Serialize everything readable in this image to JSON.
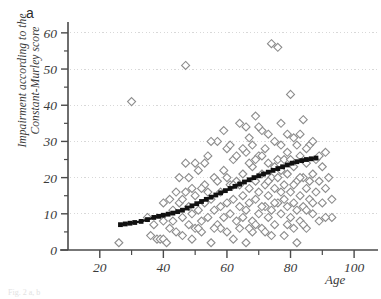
{
  "figure": {
    "panel_label": "a",
    "bottom_caption": "Fig. 2  a, b",
    "colors": {
      "axis": "#4a4a4a",
      "grid": "#d8d8d8",
      "marker_stroke": "#8c8c8c",
      "marker_fill": "#ffffff",
      "trend": "#111111",
      "text": "#3a3a3a"
    }
  },
  "chart_data": {
    "type": "scatter",
    "title": "",
    "subtitle": "",
    "xlabel": "Age",
    "ylabel": "Impairment according to the Constant-Murley score",
    "ylabel_line1": "Impairment according to the",
    "ylabel_line2": "Constant-Murley score",
    "xlim": [
      10,
      105
    ],
    "ylim": [
      0,
      63
    ],
    "xticks": [
      20,
      40,
      60,
      80,
      100
    ],
    "yticks": [
      0,
      10,
      20,
      30,
      40,
      50,
      60
    ],
    "xtick_labels": [
      "20",
      "40",
      "60",
      "80",
      "100"
    ],
    "ytick_labels": [
      "0",
      "10",
      "20",
      "30",
      "40",
      "50",
      "60"
    ],
    "x_minor_ticks": [
      30,
      50,
      70,
      90
    ],
    "y_minor_ticks": [
      5,
      15,
      25,
      35,
      45,
      55
    ],
    "grid": "horizontal-dotted",
    "legend": "none",
    "marker": "open-diamond",
    "series": [
      {
        "name": "Patients",
        "marker": "open-diamond",
        "points": [
          [
            26,
            2
          ],
          [
            30,
            41
          ],
          [
            35,
            9
          ],
          [
            36,
            4
          ],
          [
            37,
            7
          ],
          [
            38,
            3
          ],
          [
            39,
            3
          ],
          [
            40,
            3
          ],
          [
            40,
            8
          ],
          [
            41,
            2
          ],
          [
            42,
            6
          ],
          [
            43,
            11
          ],
          [
            44,
            5
          ],
          [
            45,
            13
          ],
          [
            46,
            4
          ],
          [
            46,
            9
          ],
          [
            47,
            51
          ],
          [
            47,
            16
          ],
          [
            48,
            12
          ],
          [
            48,
            7
          ],
          [
            49,
            10
          ],
          [
            49,
            3
          ],
          [
            50,
            15
          ],
          [
            50,
            6
          ],
          [
            51,
            22
          ],
          [
            51,
            11
          ],
          [
            52,
            8
          ],
          [
            52,
            5
          ],
          [
            53,
            18
          ],
          [
            53,
            13
          ],
          [
            54,
            26
          ],
          [
            54,
            9
          ],
          [
            55,
            2
          ],
          [
            55,
            14
          ],
          [
            56,
            20
          ],
          [
            56,
            11
          ],
          [
            57,
            7
          ],
          [
            57,
            30
          ],
          [
            58,
            16
          ],
          [
            58,
            12
          ],
          [
            59,
            9
          ],
          [
            59,
            22
          ],
          [
            60,
            13
          ],
          [
            60,
            5
          ],
          [
            60,
            28
          ],
          [
            61,
            18
          ],
          [
            61,
            10
          ],
          [
            62,
            25
          ],
          [
            62,
            14
          ],
          [
            62,
            3
          ],
          [
            63,
            8
          ],
          [
            63,
            19
          ],
          [
            64,
            35
          ],
          [
            64,
            12
          ],
          [
            64,
            6
          ],
          [
            65,
            21
          ],
          [
            65,
            15
          ],
          [
            65,
            9
          ],
          [
            66,
            27
          ],
          [
            66,
            11
          ],
          [
            66,
            2
          ],
          [
            67,
            17
          ],
          [
            67,
            13
          ],
          [
            67,
            31
          ],
          [
            68,
            23
          ],
          [
            68,
            8
          ],
          [
            68,
            5
          ],
          [
            69,
            19
          ],
          [
            69,
            14
          ],
          [
            69,
            37
          ],
          [
            70,
            26
          ],
          [
            70,
            10
          ],
          [
            70,
            16
          ],
          [
            71,
            21
          ],
          [
            71,
            6
          ],
          [
            71,
            33
          ],
          [
            72,
            12
          ],
          [
            72,
            18
          ],
          [
            72,
            28
          ],
          [
            73,
            9
          ],
          [
            73,
            24
          ],
          [
            73,
            15
          ],
          [
            74,
            57
          ],
          [
            74,
            20
          ],
          [
            74,
            11
          ],
          [
            75,
            30
          ],
          [
            75,
            17
          ],
          [
            75,
            7
          ],
          [
            76,
            56
          ],
          [
            76,
            25
          ],
          [
            76,
            13
          ],
          [
            77,
            22
          ],
          [
            77,
            10
          ],
          [
            77,
            35
          ],
          [
            78,
            18
          ],
          [
            78,
            14
          ],
          [
            78,
            4
          ],
          [
            79,
            27
          ],
          [
            79,
            21
          ],
          [
            79,
            12
          ],
          [
            80,
            43
          ],
          [
            80,
            16
          ],
          [
            80,
            9
          ],
          [
            81,
            31
          ],
          [
            81,
            23
          ],
          [
            81,
            13
          ],
          [
            82,
            19
          ],
          [
            82,
            11
          ],
          [
            82,
            2
          ],
          [
            83,
            26
          ],
          [
            83,
            15
          ],
          [
            83,
            8
          ],
          [
            84,
            36
          ],
          [
            84,
            20
          ],
          [
            84,
            12
          ],
          [
            85,
            24
          ],
          [
            85,
            17
          ],
          [
            85,
            6
          ],
          [
            86,
            29
          ],
          [
            86,
            14
          ],
          [
            87,
            21
          ],
          [
            87,
            10
          ],
          [
            88,
            25
          ],
          [
            88,
            16
          ],
          [
            89,
            19
          ],
          [
            89,
            8
          ],
          [
            90,
            23
          ],
          [
            90,
            13
          ],
          [
            91,
            27
          ],
          [
            91,
            17
          ],
          [
            92,
            20
          ],
          [
            93,
            14
          ],
          [
            93,
            9
          ],
          [
            44,
            16
          ],
          [
            45,
            20
          ],
          [
            47,
            24
          ],
          [
            49,
            17
          ],
          [
            51,
            6
          ],
          [
            53,
            24
          ],
          [
            55,
            30
          ],
          [
            57,
            19
          ],
          [
            58,
            6
          ],
          [
            59,
            33
          ],
          [
            61,
            29
          ],
          [
            63,
            26
          ],
          [
            64,
            18
          ],
          [
            66,
            34
          ],
          [
            67,
            6
          ],
          [
            68,
            29
          ],
          [
            69,
            7
          ],
          [
            70,
            34
          ],
          [
            71,
            12
          ],
          [
            72,
            5
          ],
          [
            73,
            32
          ],
          [
            74,
            4
          ],
          [
            75,
            13
          ],
          [
            76,
            20
          ],
          [
            77,
            29
          ],
          [
            78,
            25
          ],
          [
            79,
            7
          ],
          [
            80,
            25
          ],
          [
            81,
            6
          ],
          [
            82,
            29
          ],
          [
            83,
            32
          ],
          [
            84,
            7
          ],
          [
            85,
            28
          ],
          [
            86,
            19
          ],
          [
            87,
            30
          ],
          [
            40,
            13
          ],
          [
            42,
            14
          ],
          [
            43,
            8
          ],
          [
            46,
            14
          ],
          [
            48,
            20
          ],
          [
            50,
            24
          ],
          [
            52,
            17
          ],
          [
            54,
            16
          ],
          [
            56,
            6
          ],
          [
            60,
            20
          ],
          [
            62,
            18
          ],
          [
            65,
            28
          ],
          [
            67,
            24
          ],
          [
            69,
            25
          ],
          [
            71,
            26
          ],
          [
            73,
            19
          ],
          [
            75,
            23
          ],
          [
            77,
            16
          ],
          [
            79,
            32
          ],
          [
            81,
            18
          ],
          [
            83,
            20
          ],
          [
            85,
            11
          ],
          [
            87,
            13
          ],
          [
            89,
            26
          ],
          [
            91,
            9
          ]
        ]
      }
    ],
    "trendline": {
      "name": "Fitted trend",
      "style": "thick-black-squares",
      "points": [
        [
          26.5,
          7.0
        ],
        [
          28,
          7.2
        ],
        [
          29.5,
          7.4
        ],
        [
          31,
          7.6
        ],
        [
          33,
          7.9
        ],
        [
          35,
          8.4
        ],
        [
          37,
          9.0
        ],
        [
          38.5,
          9.3
        ],
        [
          40,
          9.6
        ],
        [
          41.5,
          9.9
        ],
        [
          43,
          10.2
        ],
        [
          44.5,
          10.6
        ],
        [
          46,
          11.0
        ],
        [
          47.5,
          11.6
        ],
        [
          49,
          12.2
        ],
        [
          50.5,
          12.8
        ],
        [
          52,
          13.4
        ],
        [
          53.5,
          14.0
        ],
        [
          55,
          14.6
        ],
        [
          56.5,
          15.2
        ],
        [
          58,
          15.8
        ],
        [
          59.5,
          16.4
        ],
        [
          61,
          17.0
        ],
        [
          62.5,
          17.6
        ],
        [
          64,
          18.2
        ],
        [
          65.5,
          18.8
        ],
        [
          67,
          19.4
        ],
        [
          68.5,
          20.0
        ],
        [
          70,
          20.5
        ],
        [
          71.5,
          21.0
        ],
        [
          73,
          21.5
        ],
        [
          74.5,
          22.0
        ],
        [
          76,
          22.5
        ],
        [
          77.5,
          23.0
        ],
        [
          79,
          23.5
        ],
        [
          80.5,
          24.0
        ],
        [
          82,
          24.4
        ],
        [
          83.5,
          24.7
        ],
        [
          85,
          25.0
        ],
        [
          86.5,
          25.2
        ],
        [
          88,
          25.4
        ]
      ]
    }
  }
}
